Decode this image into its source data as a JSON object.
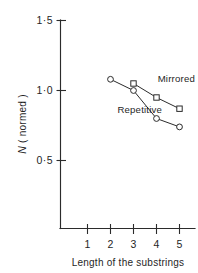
{
  "chart_data": {
    "type": "line",
    "title": "",
    "subtitle": "",
    "xlabel": "Length of the substrings",
    "ylabel": "N (normed)",
    "ylabel_italic_part": "N",
    "ylabel_rest": " ( normed )",
    "x": [
      1,
      2,
      3,
      4,
      5
    ],
    "xlim": [
      0.55,
      5.45
    ],
    "ylim": [
      0.0,
      1.62
    ],
    "xtick_labels": [
      "1",
      "2",
      "3",
      "4",
      "5"
    ],
    "xtick_values": [
      1,
      2,
      3,
      4,
      5
    ],
    "ytick_labels": [
      "0·5",
      "1·0",
      "1·5"
    ],
    "ytick_values": [
      0.5,
      1.0,
      1.5
    ],
    "grid": false,
    "legend_position": "inline-annotation",
    "series": [
      {
        "name": "Mirrored",
        "marker": "square",
        "x": [
          3,
          4,
          5
        ],
        "values": [
          1.05,
          0.95,
          0.87
        ]
      },
      {
        "name": "Repetitive",
        "marker": "circle",
        "x": [
          2,
          3,
          4,
          5
        ],
        "values": [
          1.08,
          1.0,
          0.8,
          0.74
        ]
      }
    ],
    "annotations": [
      {
        "text": "Mirrored",
        "x": 4.05,
        "y": 1.06
      },
      {
        "text": "Repetitive",
        "x": 2.3,
        "y": 0.84
      }
    ],
    "colors": {
      "line": "#2b2b2b",
      "marker_fill": "#ffffff",
      "axis": "#2b2b2b",
      "background": "#ffffff",
      "text": "#1f1f1f"
    }
  }
}
